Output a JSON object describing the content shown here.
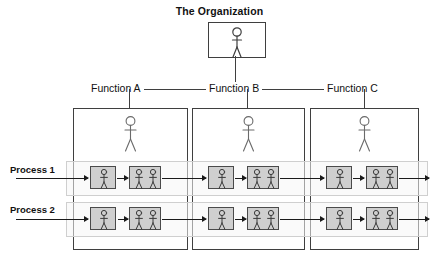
{
  "diagram": {
    "title": "The Organization",
    "type": "cross-functional process / swimlane organization chart",
    "colors": {
      "activity_fill": "#cfcfcf",
      "activity_stroke": "#4a4a4a",
      "box_stroke": "#3f3f3f",
      "lane_fill": "#f5f5f5",
      "lane_stroke": "#cfcfcf",
      "line": "#1a1a1a",
      "text": "#111111",
      "background": "#ffffff"
    },
    "organization": {
      "label": "The Organization",
      "person_count": 1
    },
    "functions": [
      {
        "label": "Function A",
        "person_count": 1
      },
      {
        "label": "Function B",
        "person_count": 1
      },
      {
        "label": "Function C",
        "person_count": 1
      }
    ],
    "processes": [
      {
        "label": "Process 1",
        "steps": [
          {
            "function": "Function A",
            "person_count": 1
          },
          {
            "function": "Function A",
            "person_count": 2
          },
          {
            "function": "Function B",
            "person_count": 1
          },
          {
            "function": "Function B",
            "person_count": 2
          },
          {
            "function": "Function C",
            "person_count": 1
          },
          {
            "function": "Function C",
            "person_count": 2
          }
        ]
      },
      {
        "label": "Process 2",
        "steps": [
          {
            "function": "Function A",
            "person_count": 1
          },
          {
            "function": "Function A",
            "person_count": 2
          },
          {
            "function": "Function B",
            "person_count": 1
          },
          {
            "function": "Function B",
            "person_count": 2
          },
          {
            "function": "Function C",
            "person_count": 1
          },
          {
            "function": "Function C",
            "person_count": 2
          }
        ]
      }
    ]
  }
}
